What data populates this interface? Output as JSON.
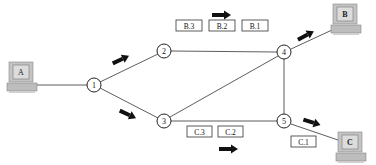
{
  "diagram": {
    "type": "packet-switching network",
    "hosts": [
      {
        "id": "A",
        "label": "A",
        "x": 22,
        "y": 78
      },
      {
        "id": "B",
        "label": "B",
        "x": 344,
        "y": 20
      },
      {
        "id": "C",
        "label": "C",
        "x": 350,
        "y": 145
      }
    ],
    "nodes": [
      {
        "id": "1",
        "label": "1",
        "x": 94,
        "y": 85
      },
      {
        "id": "2",
        "label": "2",
        "x": 164,
        "y": 51
      },
      {
        "id": "3",
        "label": "3",
        "x": 164,
        "y": 121
      },
      {
        "id": "4",
        "label": "4",
        "x": 284,
        "y": 52
      },
      {
        "id": "5",
        "label": "5",
        "x": 284,
        "y": 121
      }
    ],
    "links": [
      [
        "A",
        "1"
      ],
      [
        "1",
        "2"
      ],
      [
        "1",
        "3"
      ],
      [
        "2",
        "4"
      ],
      [
        "3",
        "4"
      ],
      [
        "3",
        "5"
      ],
      [
        "4",
        "5"
      ],
      [
        "4",
        "B"
      ],
      [
        "5",
        "C"
      ]
    ],
    "packets_b": [
      {
        "label": "B.3",
        "x": 176,
        "y": 20
      },
      {
        "label": "B.2",
        "x": 209,
        "y": 20
      },
      {
        "label": "B.1",
        "x": 242,
        "y": 20
      }
    ],
    "packets_c": [
      {
        "label": "C.3",
        "x": 187,
        "y": 126
      },
      {
        "label": "C.2",
        "x": 218,
        "y": 126
      },
      {
        "label": "C.1",
        "x": 291,
        "y": 136
      }
    ],
    "caption": ""
  },
  "colors": {
    "line": "#333333",
    "arrow": "#111111",
    "pc_body": "#c8c8c8",
    "pc_screen": "#e8e8e8"
  }
}
